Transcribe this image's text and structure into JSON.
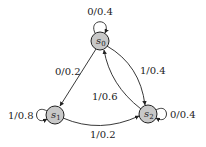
{
  "diagram": {
    "type": "state-transition",
    "nodes": [
      {
        "id": "s0",
        "name": "s",
        "sub": "0",
        "x": 100,
        "y": 41
      },
      {
        "id": "s1",
        "name": "s",
        "sub": "1",
        "x": 55,
        "y": 115
      },
      {
        "id": "s2",
        "name": "s",
        "sub": "2",
        "x": 148,
        "y": 114
      }
    ],
    "edges": [
      {
        "from": "s0",
        "to": "s0",
        "label": "0/0.4"
      },
      {
        "from": "s0",
        "to": "s1",
        "label": "0/0.2"
      },
      {
        "from": "s0",
        "to": "s2",
        "label": "1/0.4"
      },
      {
        "from": "s2",
        "to": "s0",
        "label": "1/0.6"
      },
      {
        "from": "s1",
        "to": "s1",
        "label": "1/0.8"
      },
      {
        "from": "s1",
        "to": "s2",
        "label": "1/0.2"
      },
      {
        "from": "s2",
        "to": "s2",
        "label": "0/0.4"
      }
    ],
    "colors": {
      "node_fill": "#c8c8c8",
      "stroke": "#222222"
    }
  }
}
